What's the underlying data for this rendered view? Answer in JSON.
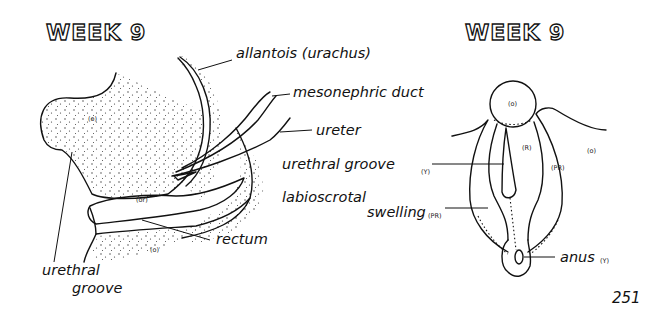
{
  "left_panel": {
    "title": "WEEK 9",
    "labels": {
      "allantois": "allantois (urachus)",
      "mesonephric": "mesonephric duct",
      "ureter": "ureter",
      "urethral_groove": "urethral",
      "urethral_groove_2": "groove",
      "rectum": "rectum"
    },
    "region_codes": {
      "bladder": "(o)",
      "urogenital_sinus": "(or)",
      "perineum": "(o)"
    }
  },
  "middle_labels": {
    "urethral_groove": "urethral groove",
    "urethral_groove_code": "(Y)",
    "labioscrotal_1": "labioscrotal",
    "labioscrotal_2": "swelling",
    "labioscrotal_code": "(PR)"
  },
  "right_panel": {
    "title": "WEEK 9",
    "labels": {
      "anus": "anus",
      "anus_code": "(Y)"
    },
    "region_codes": {
      "tubercle": "(o)",
      "fold": "(R)",
      "swelling": "(PR)",
      "outer": "(o)"
    }
  },
  "page_number": "251",
  "colors": {
    "ink": "#111111",
    "paper": "#ffffff"
  }
}
